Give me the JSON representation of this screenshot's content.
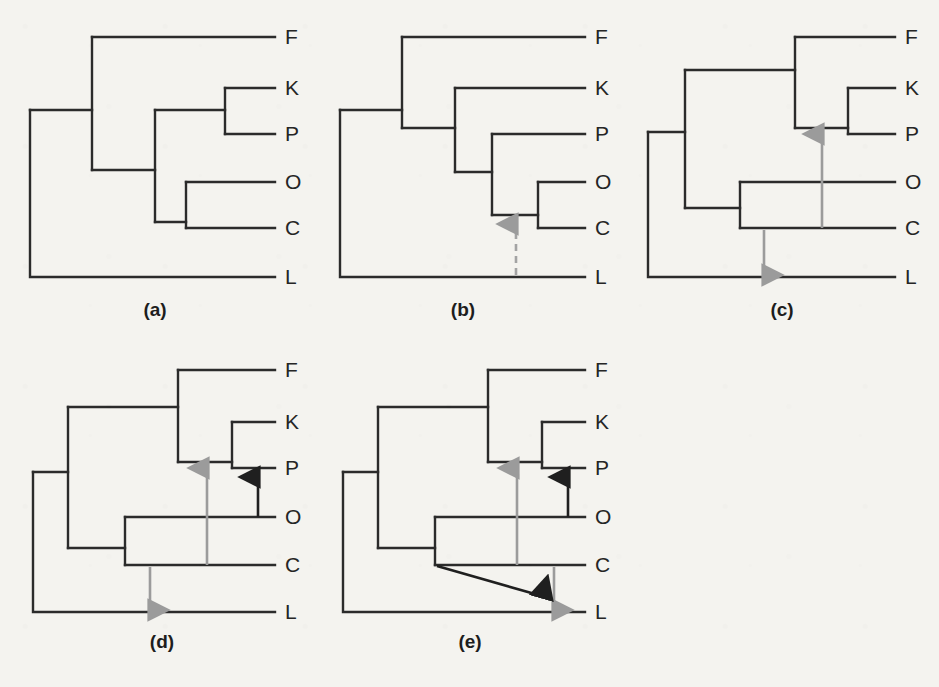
{
  "figure": {
    "background_color": "#f4f3ef",
    "line_color": "#2b2b2b",
    "gray_arrow_color": "#9b9b9b",
    "dark_arrow_color": "#1f1f1f",
    "width": 939,
    "height": 687
  },
  "taxa": [
    "F",
    "K",
    "P",
    "O",
    "C",
    "L"
  ],
  "panels": [
    {
      "id": "a",
      "caption": "(a)",
      "caption_x": 155,
      "caption_y": 316,
      "topology": "(L,(F,((K,P),(O,C))))",
      "tips": [
        {
          "label": "F",
          "x": 285,
          "y": 44
        },
        {
          "label": "K",
          "x": 285,
          "y": 95
        },
        {
          "label": "P",
          "x": 285,
          "y": 141
        },
        {
          "label": "O",
          "x": 285,
          "y": 189
        },
        {
          "label": "C",
          "x": 285,
          "y": 235
        },
        {
          "label": "L",
          "x": 285,
          "y": 284
        }
      ],
      "arrows": []
    },
    {
      "id": "b",
      "caption": "(b)",
      "caption_x": 463,
      "caption_y": 316,
      "topology": "(L,(F,(K,(P,(O,C)))))",
      "tips": [
        {
          "label": "F",
          "x": 595,
          "y": 44
        },
        {
          "label": "K",
          "x": 595,
          "y": 95
        },
        {
          "label": "P",
          "x": 595,
          "y": 141
        },
        {
          "label": "O",
          "x": 595,
          "y": 189
        },
        {
          "label": "C",
          "x": 595,
          "y": 235
        },
        {
          "label": "L",
          "x": 595,
          "y": 284
        }
      ],
      "arrows": [
        {
          "name": "transfer-arrow-L-to-OC",
          "style": "gray-dashed",
          "direction": "up",
          "from": "L",
          "to": "OC-node"
        }
      ]
    },
    {
      "id": "c",
      "caption": "(c)",
      "caption_x": 782,
      "caption_y": 316,
      "topology": "(L,((F,(K,P)),(O,C)))",
      "tips": [
        {
          "label": "F",
          "x": 905,
          "y": 44
        },
        {
          "label": "K",
          "x": 905,
          "y": 95
        },
        {
          "label": "P",
          "x": 905,
          "y": 141
        },
        {
          "label": "O",
          "x": 905,
          "y": 189
        },
        {
          "label": "C",
          "x": 905,
          "y": 235
        },
        {
          "label": "L",
          "x": 905,
          "y": 284
        }
      ],
      "arrows": [
        {
          "name": "transfer-arrow-C-to-FKP",
          "style": "gray",
          "direction": "up",
          "from": "C",
          "to": "F-clade-node"
        },
        {
          "name": "transfer-arrow-OC-to-L",
          "style": "gray",
          "direction": "down",
          "from": "OC-node",
          "to": "L"
        }
      ]
    },
    {
      "id": "d",
      "caption": "(d)",
      "caption_x": 162,
      "caption_y": 648,
      "topology": "(L,((F,(K,P)),(O,C)))",
      "tips": [
        {
          "label": "F",
          "x": 285,
          "y": 377
        },
        {
          "label": "K",
          "x": 285,
          "y": 429
        },
        {
          "label": "P",
          "x": 285,
          "y": 475
        },
        {
          "label": "O",
          "x": 285,
          "y": 524
        },
        {
          "label": "C",
          "x": 285,
          "y": 572
        },
        {
          "label": "L",
          "x": 285,
          "y": 619
        }
      ],
      "arrows": [
        {
          "name": "transfer-arrow-C-to-FKP",
          "style": "gray",
          "direction": "up",
          "from": "C",
          "to": "F-clade-node"
        },
        {
          "name": "transfer-arrow-OC-to-L",
          "style": "gray",
          "direction": "down",
          "from": "OC-node",
          "to": "L"
        },
        {
          "name": "transfer-arrow-O-to-P",
          "style": "dark",
          "direction": "up",
          "from": "O",
          "to": "P"
        }
      ]
    },
    {
      "id": "e",
      "caption": "(e)",
      "caption_x": 470,
      "caption_y": 648,
      "topology": "(L,((F,(K,P)),(O,C)))",
      "tips": [
        {
          "label": "F",
          "x": 595,
          "y": 377
        },
        {
          "label": "K",
          "x": 595,
          "y": 429
        },
        {
          "label": "P",
          "x": 595,
          "y": 475
        },
        {
          "label": "O",
          "x": 595,
          "y": 524
        },
        {
          "label": "C",
          "x": 595,
          "y": 572
        },
        {
          "label": "L",
          "x": 595,
          "y": 619
        }
      ],
      "arrows": [
        {
          "name": "transfer-arrow-C-to-FKP",
          "style": "gray",
          "direction": "up",
          "from": "C",
          "to": "F-clade-node"
        },
        {
          "name": "transfer-arrow-O-to-P",
          "style": "dark",
          "direction": "up",
          "from": "O",
          "to": "P"
        },
        {
          "name": "transfer-arrow-OC-to-L",
          "style": "gray",
          "direction": "down",
          "from": "OC-node",
          "to": "L"
        },
        {
          "name": "transfer-arrow-OC-diagonal-to-L",
          "style": "dark",
          "direction": "diagonal-down-right",
          "from": "OC-node",
          "to": "L-transfer-point"
        }
      ]
    }
  ]
}
